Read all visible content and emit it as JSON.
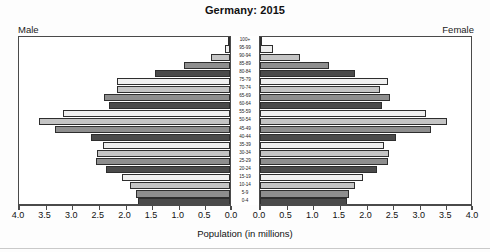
{
  "title": "Germany: 2015",
  "male_label": "Male",
  "female_label": "Female",
  "axis_caption": "Population (in millions)",
  "chart_data": {
    "type": "bar",
    "subtype": "population-pyramid",
    "title": "Germany: 2015",
    "xlabel": "Population (in millions)",
    "ylabel": "",
    "categories": [
      "0-4",
      "5-9",
      "10-14",
      "15-19",
      "20-24",
      "25-29",
      "30-34",
      "35-39",
      "40-44",
      "45-49",
      "50-54",
      "55-59",
      "60-64",
      "65-69",
      "70-74",
      "75-79",
      "80-84",
      "85-89",
      "90-94",
      "95-99",
      "100+"
    ],
    "tick_labels_left": [
      "4.0",
      "3.5",
      "3.0",
      "2.5",
      "2.0",
      "1.5",
      "1.0",
      "0.5",
      "0.0"
    ],
    "tick_labels_right": [
      "0.0",
      "0.5",
      "1.0",
      "1.5",
      "2.0",
      "2.5",
      "3.0",
      "3.5",
      "4.0"
    ],
    "xlim": [
      0,
      4.0
    ],
    "xtick_step": 0.5,
    "grid": false,
    "legend": "none",
    "series": [
      {
        "name": "Male",
        "side": "left",
        "values": [
          1.73,
          1.77,
          1.88,
          2.03,
          2.32,
          2.52,
          2.5,
          2.38,
          2.62,
          3.29,
          3.58,
          3.14,
          2.27,
          2.36,
          2.12,
          2.13,
          1.4,
          0.86,
          0.36,
          0.09,
          0.01
        ]
      },
      {
        "name": "Female",
        "side": "right",
        "values": [
          1.64,
          1.68,
          1.79,
          1.93,
          2.2,
          2.41,
          2.43,
          2.33,
          2.56,
          3.22,
          3.52,
          3.12,
          2.3,
          2.44,
          2.26,
          2.41,
          1.79,
          1.3,
          0.75,
          0.25,
          0.04
        ]
      }
    ],
    "shades": [
      "#4a4a4a",
      "#8e8e8e",
      "#c4c4c4",
      "#efefef"
    ]
  }
}
